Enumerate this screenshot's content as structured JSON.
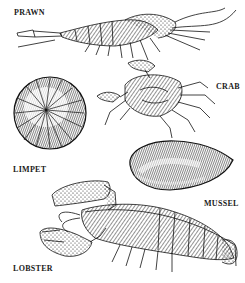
{
  "illustration": {
    "style": "black-and-white pen-and-ink engraving",
    "background": "#ffffff",
    "ink": "#111111",
    "labels": [
      {
        "id": "prawn",
        "text": "PRAWN"
      },
      {
        "id": "crab",
        "text": "CRAB"
      },
      {
        "id": "limpet",
        "text": "LIMPET"
      },
      {
        "id": "mussel",
        "text": "MUSSEL"
      },
      {
        "id": "lobster",
        "text": "LOBSTER"
      }
    ]
  }
}
